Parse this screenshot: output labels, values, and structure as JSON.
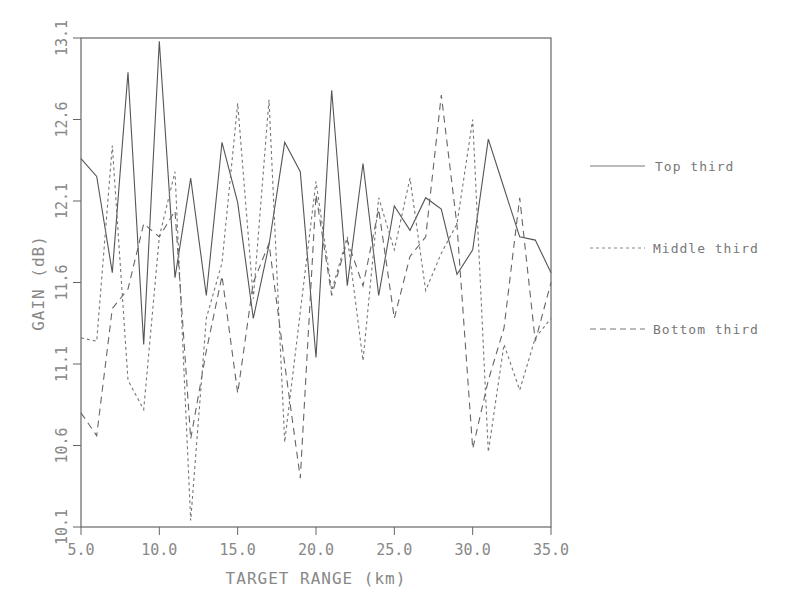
{
  "chart_data": {
    "type": "line",
    "title": "",
    "xlabel": "TARGET RANGE (km)",
    "ylabel": "GAIN (dB)",
    "xlim": [
      5.0,
      35.0
    ],
    "ylim": [
      10.1,
      13.1
    ],
    "xticks": [
      "5.0",
      "10.0",
      "15.0",
      "20.0",
      "25.0",
      "30.0",
      "35.0"
    ],
    "yticks": [
      "10.1",
      "10.6",
      "11.1",
      "11.6",
      "12.1",
      "12.6",
      "13.1"
    ],
    "grid": false,
    "legend_position": "right",
    "x": [
      5,
      6,
      7,
      8,
      9,
      10,
      11,
      12,
      13,
      14,
      15,
      16,
      17,
      18,
      19,
      20,
      21,
      22,
      23,
      24,
      25,
      26,
      27,
      28,
      29,
      30,
      31,
      32,
      33,
      34,
      35
    ],
    "series": [
      {
        "name": "Top third",
        "style": "solid",
        "values": [
          12.36,
          12.25,
          11.66,
          12.89,
          11.22,
          13.08,
          11.63,
          12.24,
          11.52,
          12.46,
          12.09,
          11.38,
          11.83,
          12.46,
          12.28,
          11.14,
          12.78,
          11.58,
          12.33,
          11.52,
          12.07,
          11.92,
          12.12,
          12.05,
          11.65,
          11.8,
          12.48,
          12.18,
          11.88,
          11.86,
          11.66
        ]
      },
      {
        "name": "Middle third",
        "style": "dotted",
        "values": [
          11.26,
          11.24,
          12.44,
          11.0,
          10.82,
          11.88,
          12.28,
          10.14,
          11.38,
          11.72,
          12.7,
          11.5,
          12.72,
          10.62,
          11.42,
          12.22,
          11.55,
          11.88,
          11.12,
          12.12,
          11.8,
          12.24,
          11.55,
          11.78,
          11.96,
          12.6,
          10.56,
          11.22,
          10.94,
          11.26,
          11.38
        ]
      },
      {
        "name": "Bottom third",
        "style": "dashed",
        "values": [
          10.8,
          10.66,
          11.44,
          11.56,
          11.96,
          11.88,
          12.04,
          10.64,
          11.18,
          11.64,
          10.92,
          11.6,
          11.84,
          11.1,
          10.4,
          12.14,
          11.52,
          11.86,
          11.58,
          12.05,
          11.38,
          11.76,
          11.88,
          12.75,
          11.95,
          10.58,
          11.0,
          11.32,
          12.12,
          11.24,
          11.6
        ]
      }
    ]
  },
  "legend": {
    "items": [
      {
        "label": "Top third"
      },
      {
        "label": "Middle third"
      },
      {
        "label": "Bottom third"
      }
    ]
  }
}
